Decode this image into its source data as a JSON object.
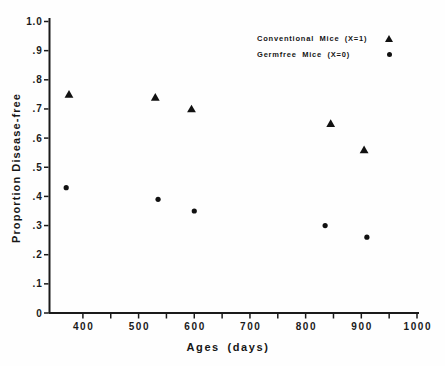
{
  "figure": {
    "background_color": "#fefefe",
    "ink_color": "#1a1a1a",
    "marker_color": "#111111"
  },
  "chart_data": {
    "type": "scatter",
    "title": "",
    "xlabel": "Ages (days)",
    "ylabel": "Proportion Disease-free",
    "xlim": [
      340,
      1000
    ],
    "ylim": [
      0,
      1.0
    ],
    "grid": false,
    "legend_position": "top-right-inside",
    "x_ticks": [
      {
        "v": 400,
        "label": "400"
      },
      {
        "v": 450,
        "label": ""
      },
      {
        "v": 500,
        "label": "500"
      },
      {
        "v": 550,
        "label": ""
      },
      {
        "v": 600,
        "label": "600"
      },
      {
        "v": 650,
        "label": ""
      },
      {
        "v": 700,
        "label": "700"
      },
      {
        "v": 750,
        "label": ""
      },
      {
        "v": 800,
        "label": "800"
      },
      {
        "v": 850,
        "label": ""
      },
      {
        "v": 900,
        "label": "900"
      },
      {
        "v": 950,
        "label": ""
      },
      {
        "v": 1000,
        "label": "1000"
      }
    ],
    "y_ticks": [
      {
        "v": 0,
        "label": "0"
      },
      {
        "v": 0.1,
        "label": ".1"
      },
      {
        "v": 0.2,
        "label": ".2"
      },
      {
        "v": 0.3,
        "label": ".3"
      },
      {
        "v": 0.4,
        "label": ".4"
      },
      {
        "v": 0.5,
        "label": ".5"
      },
      {
        "v": 0.6,
        "label": ".6"
      },
      {
        "v": 0.7,
        "label": ".7"
      },
      {
        "v": 0.8,
        "label": ".8"
      },
      {
        "v": 0.9,
        "label": ".9"
      },
      {
        "v": 1.0,
        "label": "1.0"
      }
    ],
    "series": [
      {
        "name": "Conventional Mice (X=1)",
        "marker": "triangle",
        "points": [
          [
            375,
            0.75
          ],
          [
            530,
            0.74
          ],
          [
            595,
            0.7
          ],
          [
            845,
            0.65
          ],
          [
            905,
            0.56
          ]
        ]
      },
      {
        "name": "Germfree Mice (X=0)",
        "marker": "dot",
        "points": [
          [
            370,
            0.43
          ],
          [
            535,
            0.39
          ],
          [
            600,
            0.35
          ],
          [
            835,
            0.3
          ],
          [
            910,
            0.26
          ]
        ]
      }
    ]
  }
}
